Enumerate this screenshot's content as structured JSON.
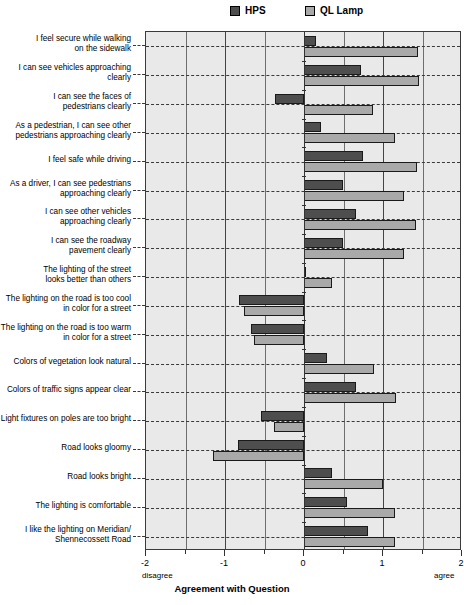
{
  "legend": {
    "position": "top-center",
    "entries": [
      {
        "label": "HPS",
        "color": "#4e4e4e",
        "swatch_name": "legend-swatch-hps"
      },
      {
        "label": "QL Lamp",
        "color": "#a9a9a9",
        "swatch_name": "legend-swatch-ql-lamp"
      }
    ]
  },
  "axis": {
    "xlabel": "Agreement with Question",
    "ticks": [
      "-2",
      "-1",
      "0",
      "1",
      "2"
    ],
    "tick_values": [
      -2,
      -1,
      0,
      1,
      2
    ],
    "left_end_label": "disagree",
    "right_end_label": "agree",
    "xlim": [
      -2,
      2
    ]
  },
  "chart_data": {
    "type": "bar",
    "orientation": "horizontal",
    "title": "",
    "subtitle": "",
    "xlabel": "Agreement with Question",
    "ylabel": "",
    "xlim": [
      -2,
      2
    ],
    "grid": true,
    "legend_position": "top-center",
    "annotations": [
      "disagree",
      "agree"
    ],
    "categories": [
      "I feel secure while walking on the sidewalk",
      "I can see vehicles approaching clearly",
      "I can see the faces of pedestrians clearly",
      "As a pedestrian, I can see other pedestrians approaching clearly",
      "I feel safe while driving",
      "As a driver, I can see pedestrians approaching clearly",
      "I can see other vehicles approaching clearly",
      "I can see the roadway pavement clearly",
      "The lighting of the street looks better than others",
      "The lighting on the road is too cool in color for a street",
      "The lighting on the road is too warm in color for a street",
      "Colors of vegetation look natural",
      "Colors of traffic signs appear clear",
      "Light fixtures on poles are too bright",
      "Road looks gloomy",
      "Road looks bright",
      "The lighting is comfortable",
      "I like the lighting on Meridian/ Shennecossett Road"
    ],
    "category_lines": [
      [
        "I feel secure while walking",
        "on the sidewalk"
      ],
      [
        "I can see vehicles approaching",
        "clearly"
      ],
      [
        "I can see the faces of",
        "pedestrians clearly"
      ],
      [
        "As a pedestrian, I can see other",
        "pedestrians approaching clearly"
      ],
      [
        "I feel safe while driving"
      ],
      [
        "As a driver, I can see pedestrians",
        "approaching clearly"
      ],
      [
        "I can see other vehicles",
        "approaching clearly"
      ],
      [
        "I can see the roadway",
        "pavement clearly"
      ],
      [
        "The lighting of the street",
        "looks better than others"
      ],
      [
        "The lighting on the road is too cool",
        "in color for a street"
      ],
      [
        "The lighting on the road is too warm",
        "in color for a street"
      ],
      [
        "Colors of vegetation look natural"
      ],
      [
        "Colors of traffic signs appear clear"
      ],
      [
        "Light fixtures on poles are too bright"
      ],
      [
        "Road looks gloomy"
      ],
      [
        "Road looks bright"
      ],
      [
        "The lighting is comfortable"
      ],
      [
        "I like the lighting on Meridian/",
        "Shennecossett Road"
      ]
    ],
    "series": [
      {
        "name": "HPS",
        "color": "#4e4e4e",
        "values": [
          0.15,
          0.72,
          -0.37,
          0.21,
          0.75,
          0.49,
          0.66,
          0.49,
          0.02,
          -0.82,
          -0.67,
          0.29,
          0.66,
          -0.54,
          -0.83,
          0.36,
          0.54,
          0.81
        ]
      },
      {
        "name": "QL Lamp",
        "color": "#a9a9a9",
        "values": [
          1.44,
          1.45,
          0.87,
          1.15,
          1.43,
          1.27,
          1.42,
          1.27,
          0.35,
          -0.76,
          -0.63,
          0.89,
          1.16,
          -0.38,
          -1.15,
          1.0,
          1.15,
          1.15
        ]
      }
    ]
  }
}
